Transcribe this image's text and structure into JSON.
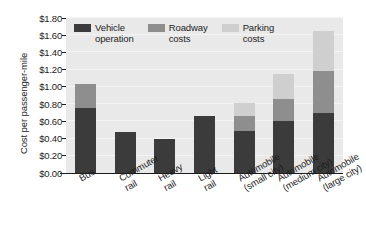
{
  "chart_data": {
    "type": "bar",
    "subtype": "stacked-bar",
    "title": "",
    "xlabel": "",
    "ylabel": "Cost per passenger-mile",
    "ylim": [
      0.0,
      1.8
    ],
    "ytick_step": 0.2,
    "ytick_labels": [
      "$0.00",
      "$0.20",
      "$0.40",
      "$0.60",
      "$0.80",
      "$1.00",
      "$1.20",
      "$1.40",
      "$1.60",
      "$1.80"
    ],
    "ytick_values": [
      0.0,
      0.2,
      0.4,
      0.6,
      0.8,
      1.0,
      1.2,
      1.4,
      1.6,
      1.8
    ],
    "grid": true,
    "legend_position": "inside-top-left",
    "categories": [
      "Bus",
      "Commuter\nrail",
      "Heavy\nrail",
      "Light\nrail",
      "Automobile\n(small city)",
      "Automobile\n(medium city)",
      "Automobile\n(large city)"
    ],
    "series": [
      {
        "name": "Vehicle\noperation",
        "legend_label": "Vehicle\noperation",
        "color": "#3b3b3b",
        "values": [
          0.76,
          0.48,
          0.4,
          0.66,
          0.49,
          0.6,
          0.7
        ]
      },
      {
        "name": "Roadway\ncosts",
        "legend_label": "Roadway\ncosts",
        "color": "#8e8e8e",
        "values": [
          0.27,
          0.0,
          0.0,
          0.0,
          0.17,
          0.26,
          0.49
        ]
      },
      {
        "name": "Parking\ncosts",
        "legend_label": "Parking\ncosts",
        "color": "#cfcfcf",
        "values": [
          0.0,
          0.0,
          0.0,
          0.0,
          0.15,
          0.29,
          0.46
        ]
      }
    ],
    "totals": [
      1.03,
      0.48,
      0.4,
      0.66,
      0.81,
      1.15,
      1.65
    ],
    "plot_background": "#e9e9e9",
    "gridline_color": "#f4f4f4",
    "axis_color": "#1c1c1c"
  }
}
